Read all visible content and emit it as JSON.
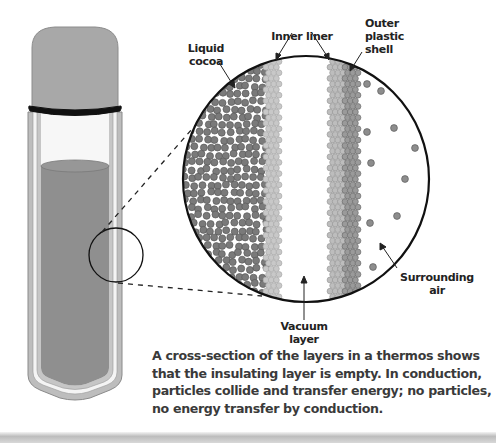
{
  "figure": {
    "type": "thermos cross-section diagram",
    "labels": {
      "liquid_cocoa": [
        "Liquid",
        "cocoa"
      ],
      "inner_liner": "Inner liner",
      "outer_shell": [
        "Outer",
        "plastic",
        "shell"
      ],
      "vacuum_layer": [
        "Vacuum",
        "layer"
      ],
      "surrounding_air": [
        "Surrounding",
        "air"
      ]
    },
    "caption": "A cross-section of the layers in a thermos shows that the insulating layer is empty. In conduction, particles collide and transfer energy; no particles, no energy transfer by conduction.",
    "colors": {
      "cap": "#a9a9a9",
      "liquid": "#8f8f8f",
      "wall": "#b9b9b9",
      "particle_dark": "#7a7a7a",
      "particle_light": "#c8c8c8",
      "particle_mid": "#9a9a9a",
      "outline": "#111111"
    }
  }
}
